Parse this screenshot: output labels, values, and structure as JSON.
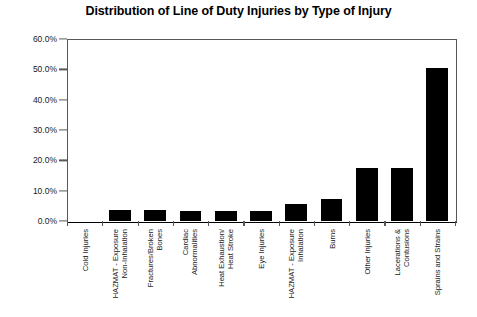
{
  "chart_data": {
    "type": "bar",
    "title": "Distribution of Line of Duty Injuries by Type of Injury",
    "xlabel": "",
    "ylabel": "",
    "ylim": [
      0,
      60
    ],
    "grid": false,
    "legend": "none",
    "orientation": "vertical",
    "bar_color": "#000000",
    "y_tick_labels": [
      "60.0%",
      "50.0%",
      "40.0%",
      "30.0%",
      "20.0%",
      "10.0%",
      "0.0%"
    ],
    "y_tick_values": [
      60.0,
      50.0,
      40.0,
      30.0,
      20.0,
      10.0,
      0.0
    ],
    "categories": [
      "Cold Injuries",
      "HAZMAT - Exposure\nNon-Inhalation",
      "Fractures/Broken\nBones",
      "Cardiac\nAbnormalities",
      "Heat Exhaustion/\nHeat Stroke",
      "Eye Injuries",
      "HAZMAT - Exposure\nInhalation",
      "Burns",
      "Other Injuries",
      "Lacerations &\nContusions",
      "Sprains and Strains"
    ],
    "values": [
      0.0,
      3.6,
      3.5,
      3.3,
      3.2,
      3.3,
      5.6,
      7.1,
      17.5,
      17.5,
      50.4
    ],
    "value_labels": [
      "0.0%",
      "3.6%",
      "3.5%",
      "3.3%",
      "3.2%",
      "3.3%",
      "5.6%",
      "7.1%",
      "17.5%",
      "17.5%",
      "50.4%"
    ]
  }
}
